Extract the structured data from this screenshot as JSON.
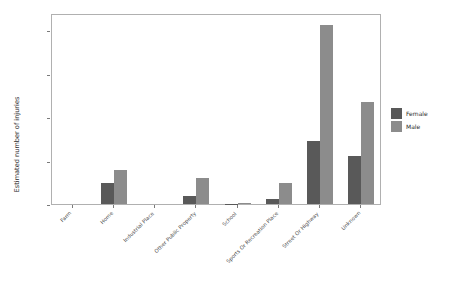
{
  "chart_data": {
    "type": "bar",
    "title": "",
    "xlabel": "",
    "ylabel": "Estimated number of injuries",
    "categories": [
      "Farm",
      "Home",
      "Industrial Place",
      "Other Public Property",
      "School",
      "Sports Or Recreation Place",
      "Street Or Highway",
      "Unknown"
    ],
    "series": [
      {
        "name": "Female",
        "color": "#595959",
        "values": [
          0,
          95000,
          0,
          38000,
          2000,
          25000,
          290000,
          220000
        ]
      },
      {
        "name": "Male",
        "color": "#8c8c8c",
        "values": [
          0,
          155000,
          0,
          120000,
          5000,
          95000,
          825000,
          470000
        ]
      }
    ],
    "ylim": [
      0,
      880000
    ],
    "yticks": [
      0,
      200000,
      400000,
      600000,
      800000
    ],
    "ytick_labels": [
      "0e+00",
      "2e+05",
      "4e+05",
      "6e+05",
      "8e+05"
    ],
    "grid": false,
    "legend_position": "right",
    "legend_title": ""
  },
  "legend": {
    "entries": [
      {
        "label": "Female",
        "color": "#595959"
      },
      {
        "label": "Male",
        "color": "#8c8c8c"
      }
    ]
  }
}
